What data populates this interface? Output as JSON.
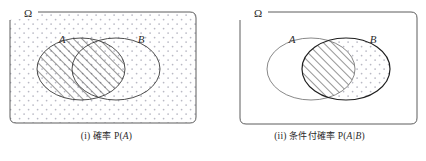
{
  "figure": {
    "type": "venn-diagram-pair",
    "background_color": "#ffffff",
    "stroke_color": "#3a3a3a",
    "hatch_color": "#2b2b2b",
    "dot_color": "#b9b9c4",
    "panels": [
      {
        "id": "i",
        "index_label": "(i)",
        "caption_cjk": "確率",
        "caption_math_prefix": "P(",
        "caption_math_arg": "A",
        "caption_math_suffix": ")",
        "caption_full": "(i) 確率 P(A)",
        "universe_label": "Ω",
        "universe_fill": "dotted",
        "sets": [
          {
            "name": "A",
            "label": "A",
            "fill": "hatched",
            "cx": 81,
            "cy": 69,
            "rx": 44,
            "ry": 31
          },
          {
            "name": "B",
            "label": "B",
            "fill": "none",
            "cx": 116,
            "cy": 69,
            "rx": 44,
            "ry": 31
          }
        ],
        "frame": {
          "x": 10,
          "y": 12,
          "width": 186,
          "height": 111
        }
      },
      {
        "id": "ii",
        "index_label": "(ii)",
        "caption_cjk": "条件付確率",
        "caption_math_prefix": "P(",
        "caption_math_arg": "A|B",
        "caption_math_suffix": ")",
        "caption_full": "(ii) 条件付確率 P(A|B)",
        "universe_label": "Ω",
        "universe_fill": "none",
        "sets": [
          {
            "name": "A",
            "label": "A",
            "fill": "none",
            "cx": 311,
            "cy": 69,
            "rx": 44,
            "ry": 31
          },
          {
            "name": "B",
            "label": "B",
            "fill": "dotted",
            "cx": 346,
            "cy": 69,
            "rx": 44,
            "ry": 31
          }
        ],
        "intersection_fill": "hatched",
        "frame": {
          "x": 240,
          "y": 12,
          "width": 177,
          "height": 112
        }
      }
    ]
  }
}
